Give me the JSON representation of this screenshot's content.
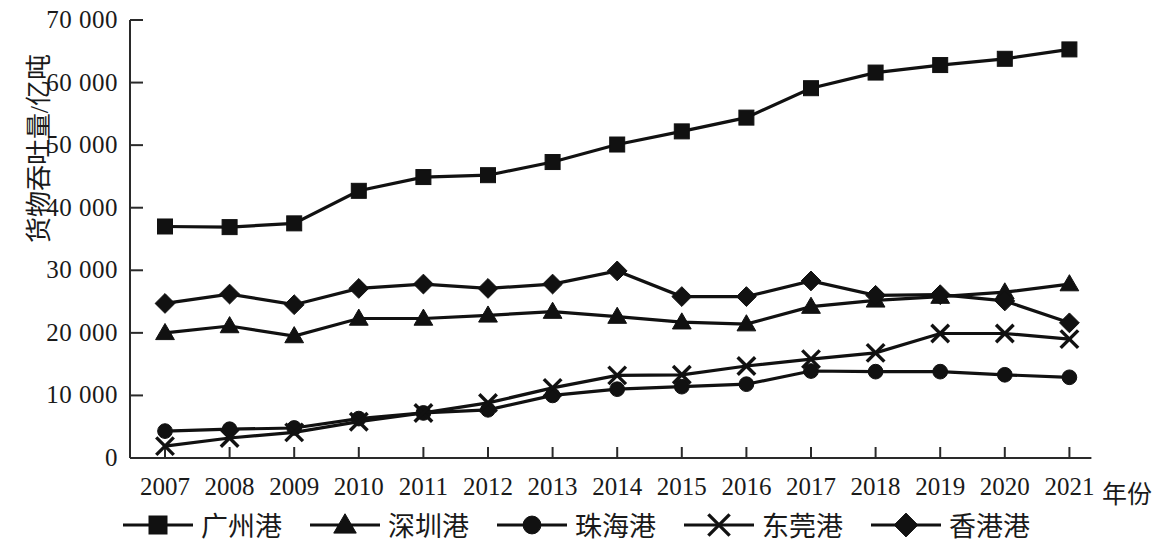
{
  "chart_data": {
    "type": "line",
    "title": "",
    "xlabel": "年份",
    "ylabel": "货物吞吐量/亿吨",
    "x": [
      2007,
      2008,
      2009,
      2010,
      2011,
      2012,
      2013,
      2014,
      2015,
      2016,
      2017,
      2018,
      2019,
      2020,
      2021
    ],
    "categories": [
      "2007",
      "2008",
      "2009",
      "2010",
      "2011",
      "2012",
      "2013",
      "2014",
      "2015",
      "2016",
      "2017",
      "2018",
      "2019",
      "2020",
      "2021"
    ],
    "xlim": [
      2007,
      2021
    ],
    "ylim": [
      0,
      70000
    ],
    "ytick_values": [
      0,
      10000,
      20000,
      30000,
      40000,
      50000,
      60000,
      70000
    ],
    "ytick_labels": [
      "0",
      "10 000",
      "20 000",
      "30 000",
      "40 000",
      "50 000",
      "60 000",
      "70 000"
    ],
    "grid": false,
    "legend_position": "bottom",
    "series": [
      {
        "name": "广州港",
        "marker": "square",
        "values": [
          37000,
          36900,
          37500,
          42700,
          44900,
          45200,
          47300,
          50100,
          52200,
          54400,
          59100,
          61600,
          62800,
          63800,
          65300
        ]
      },
      {
        "name": "深圳港",
        "marker": "triangle",
        "values": [
          20000,
          21100,
          19500,
          22300,
          22300,
          22800,
          23400,
          22600,
          21700,
          21400,
          24200,
          25200,
          25800,
          26500,
          27800
        ]
      },
      {
        "name": "珠海港",
        "marker": "circle",
        "values": [
          4300,
          4600,
          4800,
          6300,
          7200,
          7700,
          10000,
          11000,
          11400,
          11800,
          13900,
          13800,
          13800,
          13300,
          12900
        ]
      },
      {
        "name": "东莞港",
        "marker": "cross",
        "values": [
          1900,
          3200,
          4100,
          5800,
          7200,
          8800,
          11200,
          13200,
          13300,
          14700,
          15800,
          16800,
          19900,
          19900,
          19000
        ]
      },
      {
        "name": "香港港",
        "marker": "diamond",
        "values": [
          24700,
          26200,
          24500,
          27100,
          27800,
          27100,
          27800,
          29900,
          25800,
          25800,
          28300,
          26000,
          26100,
          25100,
          21600
        ]
      }
    ]
  },
  "axis": {
    "x_title": "年份",
    "y_title": "货物吞吐量/亿吨"
  },
  "legend": {
    "items": [
      {
        "label": "广州港",
        "marker": "square"
      },
      {
        "label": "深圳港",
        "marker": "triangle"
      },
      {
        "label": "珠海港",
        "marker": "circle"
      },
      {
        "label": "东莞港",
        "marker": "cross"
      },
      {
        "label": "香港港",
        "marker": "diamond"
      }
    ]
  }
}
